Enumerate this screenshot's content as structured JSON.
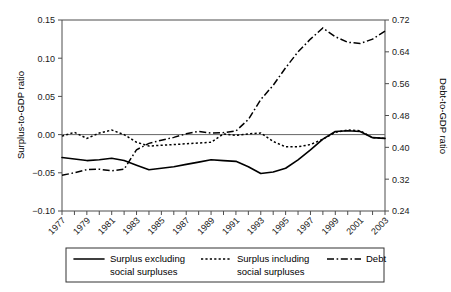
{
  "chart_data": {
    "type": "line",
    "title": "",
    "xlabel": "",
    "ylabel": "Surplus-to-GDP ratio",
    "y2label": "Debt-to-GDP ratio",
    "grid": false,
    "legend_position": "bottom",
    "x": [
      1977,
      1978,
      1979,
      1980,
      1981,
      1982,
      1983,
      1984,
      1985,
      1986,
      1987,
      1988,
      1989,
      1990,
      1991,
      1992,
      1993,
      1994,
      1995,
      1996,
      1997,
      1998,
      1999,
      2000,
      2001,
      2002,
      2003
    ],
    "xlim": [
      1977,
      2003
    ],
    "xtick_labels": [
      "1977",
      "1979",
      "1981",
      "1983",
      "1985",
      "1987",
      "1989",
      "1991",
      "1993",
      "1995",
      "1997",
      "1999",
      "2001",
      "2003"
    ],
    "xtick_values": [
      1977,
      1979,
      1981,
      1983,
      1985,
      1987,
      1989,
      1991,
      1993,
      1995,
      1997,
      1999,
      2001,
      2003
    ],
    "ylim": [
      -0.1,
      0.15
    ],
    "ytick_labels": [
      "0.15",
      "0.10",
      "0.05",
      "0.00",
      "-0.05",
      "-0.10"
    ],
    "ytick_values": [
      0.15,
      0.1,
      0.05,
      0.0,
      -0.05,
      -0.1
    ],
    "y2lim": [
      0.24,
      0.72
    ],
    "y2tick_labels": [
      "0.72",
      "0.64",
      "0.56",
      "0.48",
      "0.40",
      "0.32",
      "0.24"
    ],
    "y2tick_values": [
      0.72,
      0.64,
      0.56,
      0.48,
      0.4,
      0.32,
      0.24
    ],
    "series": [
      {
        "name": "Surplus excluding social surpluses",
        "axis": "left",
        "style": "solid",
        "values": [
          -0.03,
          -0.032,
          -0.034,
          -0.033,
          -0.031,
          -0.034,
          -0.04,
          -0.046,
          -0.044,
          -0.042,
          -0.039,
          -0.036,
          -0.033,
          -0.034,
          -0.035,
          -0.042,
          -0.051,
          -0.049,
          -0.044,
          -0.033,
          -0.02,
          -0.006,
          0.004,
          0.005,
          0.004,
          -0.004,
          -0.005
        ]
      },
      {
        "name": "Surplus including social surpluses",
        "axis": "left",
        "style": "dotted",
        "values": [
          -0.002,
          0.003,
          -0.005,
          0.002,
          0.006,
          0.0,
          -0.01,
          -0.015,
          -0.014,
          -0.013,
          -0.012,
          -0.011,
          -0.01,
          0.001,
          -0.001,
          0.001,
          0.002,
          -0.009,
          -0.016,
          -0.016,
          -0.013,
          -0.006,
          0.003,
          0.006,
          0.005,
          -0.004,
          -0.005
        ]
      },
      {
        "name": "Debt",
        "axis": "right",
        "style": "dash-dot",
        "values": [
          0.33,
          0.336,
          0.344,
          0.345,
          0.341,
          0.345,
          0.394,
          0.41,
          0.418,
          0.425,
          0.434,
          0.44,
          0.436,
          0.437,
          0.441,
          0.47,
          0.52,
          0.556,
          0.6,
          0.64,
          0.672,
          0.7,
          0.678,
          0.664,
          0.661,
          0.672,
          0.692
        ]
      }
    ]
  },
  "legend": {
    "items": [
      {
        "label_line1": "Surplus excluding",
        "label_line2": "social surpluses",
        "style": "solid"
      },
      {
        "label_line1": "Surplus including",
        "label_line2": "social surpluses",
        "style": "dotted"
      },
      {
        "label_line1": "Debt",
        "label_line2": "",
        "style": "dash-dot"
      }
    ]
  }
}
